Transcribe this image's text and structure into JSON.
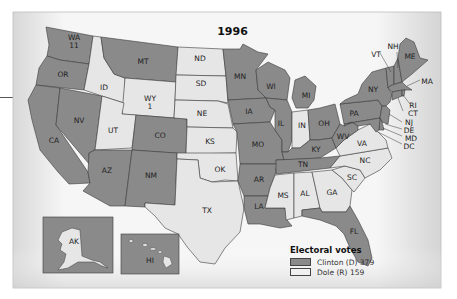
{
  "title": "1996",
  "colors": {
    "clinton": "#8a8a8a",
    "dole": "#e6e6e6",
    "background": "#f4f4f4",
    "border": "#3a3a3a"
  },
  "states": {
    "WA": {
      "label": "WA",
      "votes": "11",
      "winner": "clinton"
    },
    "OR": {
      "label": "OR",
      "winner": "clinton"
    },
    "CA": {
      "label": "CA",
      "winner": "clinton"
    },
    "NV": {
      "label": "NV",
      "winner": "clinton"
    },
    "ID": {
      "label": "ID",
      "winner": "dole"
    },
    "MT": {
      "label": "MT",
      "winner": "clinton"
    },
    "WY": {
      "label": "WY",
      "votes": "1",
      "winner": "dole"
    },
    "UT": {
      "label": "UT",
      "winner": "dole"
    },
    "CO": {
      "label": "CO",
      "winner": "clinton"
    },
    "AZ": {
      "label": "AZ",
      "winner": "clinton"
    },
    "NM": {
      "label": "NM",
      "winner": "clinton"
    },
    "ND": {
      "label": "ND",
      "winner": "dole"
    },
    "SD": {
      "label": "SD",
      "winner": "dole"
    },
    "NE": {
      "label": "NE",
      "winner": "dole"
    },
    "KS": {
      "label": "KS",
      "winner": "dole"
    },
    "OK": {
      "label": "OK",
      "winner": "dole"
    },
    "TX": {
      "label": "TX",
      "winner": "dole"
    },
    "MN": {
      "label": "MN",
      "winner": "clinton"
    },
    "IA": {
      "label": "IA",
      "winner": "clinton"
    },
    "MO": {
      "label": "MO",
      "winner": "clinton"
    },
    "AR": {
      "label": "AR",
      "winner": "clinton"
    },
    "LA": {
      "label": "LA",
      "winner": "clinton"
    },
    "WI": {
      "label": "WI",
      "winner": "clinton"
    },
    "IL": {
      "label": "IL",
      "winner": "clinton"
    },
    "MI": {
      "label": "MI",
      "winner": "clinton"
    },
    "IN": {
      "label": "IN",
      "winner": "dole"
    },
    "OH": {
      "label": "OH",
      "winner": "clinton"
    },
    "KY": {
      "label": "KY",
      "winner": "clinton"
    },
    "TN": {
      "label": "TN",
      "winner": "clinton"
    },
    "MS": {
      "label": "MS",
      "winner": "dole"
    },
    "AL": {
      "label": "AL",
      "winner": "dole"
    },
    "GA": {
      "label": "GA",
      "winner": "dole"
    },
    "FL": {
      "label": "FL",
      "winner": "clinton"
    },
    "SC": {
      "label": "SC",
      "winner": "dole"
    },
    "NC": {
      "label": "NC",
      "winner": "dole"
    },
    "VA": {
      "label": "VA",
      "winner": "dole"
    },
    "WV": {
      "label": "WV",
      "winner": "clinton"
    },
    "PA": {
      "label": "PA",
      "winner": "clinton"
    },
    "NY": {
      "label": "NY",
      "winner": "clinton"
    },
    "VT": {
      "label": "VT",
      "winner": "clinton"
    },
    "NH": {
      "label": "NH",
      "winner": "clinton"
    },
    "ME": {
      "label": "ME",
      "winner": "clinton"
    },
    "MA": {
      "label": "MA",
      "winner": "clinton"
    },
    "RI": {
      "label": "RI",
      "winner": "clinton"
    },
    "CT": {
      "label": "CT",
      "winner": "clinton"
    },
    "NJ": {
      "label": "NJ",
      "winner": "clinton"
    },
    "DE": {
      "label": "DE",
      "winner": "clinton"
    },
    "MD": {
      "label": "MD",
      "winner": "clinton"
    },
    "DC": {
      "label": "DC",
      "winner": "clinton"
    },
    "AK": {
      "label": "AK",
      "winner": "dole"
    },
    "HI": {
      "label": "HI",
      "winner": "clinton"
    }
  },
  "legend": {
    "title": "Electoral votes",
    "items": [
      {
        "label": "Clinton (D) 379",
        "color": "#8a8a8a"
      },
      {
        "label": "Dole (R) 159",
        "color": "#e6e6e6"
      }
    ]
  }
}
